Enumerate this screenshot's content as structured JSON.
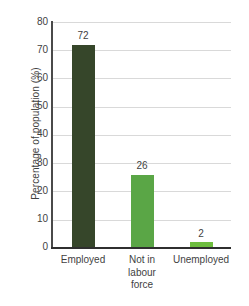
{
  "chart_data": {
    "type": "bar",
    "title": "",
    "xlabel": "",
    "ylabel": "Percentage of population (%)",
    "categories": [
      "Employed",
      "Not in labour force",
      "Unemployed"
    ],
    "category_lines": [
      [
        "Employed"
      ],
      [
        "Not in",
        "labour",
        "force"
      ],
      [
        "Unemployed"
      ]
    ],
    "values": [
      72,
      26,
      2
    ],
    "value_labels": [
      "72",
      "26",
      "2"
    ],
    "ylim": [
      0,
      80
    ],
    "yticks": [
      80,
      70,
      60,
      50,
      40,
      30,
      20,
      10,
      0
    ],
    "ytick_labels": [
      "80",
      "70",
      "60",
      "50",
      "40",
      "30",
      "20",
      "10",
      "0"
    ],
    "grid": true,
    "grid_axis": "y",
    "legend": false,
    "legend_position": "none",
    "bar_colors": [
      "#36462a",
      "#5aa646",
      "#6ebe3f"
    ],
    "colors": {
      "bar_dark_green": "#36462a",
      "bar_green": "#5aa646",
      "bar_light_green": "#6ebe3f",
      "gridline": "#d9d9d9",
      "axis": "#2f2f2f",
      "text": "#3f3f3f",
      "background": "#ffffff"
    }
  }
}
